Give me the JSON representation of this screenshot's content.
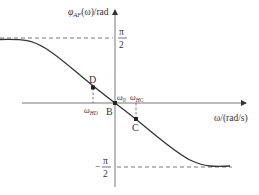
{
  "diagram": {
    "y_axis_label": "φ_AF(ω)/rad",
    "y_axis_label_main": "φ",
    "y_axis_label_sub": "AF",
    "y_axis_label_rest": "(ω)/rad",
    "x_axis_label": "ω/(rad/s)",
    "upper_asymptote": {
      "numerator": "π",
      "denominator": "2",
      "sign": ""
    },
    "lower_asymptote": {
      "numerator": "π",
      "denominator": "2",
      "sign": "−"
    },
    "points": {
      "B": {
        "label": "B",
        "freq_label": "ω",
        "freq_sub": "0"
      },
      "C": {
        "label": "C",
        "freq_label": "ω",
        "freq_sub": "HC"
      },
      "D": {
        "label": "D",
        "freq_label": "ω",
        "freq_sub": "HD"
      }
    },
    "colors": {
      "curve": "#333333",
      "axis": "#666666",
      "dashed": "#555555"
    }
  }
}
